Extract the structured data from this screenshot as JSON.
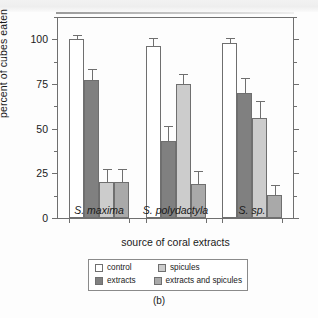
{
  "figure": {
    "caption": "(b)"
  },
  "chart_data": {
    "type": "bar",
    "title": "",
    "xlabel": "source of coral extracts",
    "ylabel": "percent of cubes eaten",
    "ylim": [
      0,
      112.5
    ],
    "yticks": [
      0,
      25,
      50,
      75,
      100
    ],
    "yticklabels": [
      "0",
      "25",
      "50",
      "75",
      "100"
    ],
    "yminorticks": [
      12.5,
      37.5,
      62.5,
      87.5,
      112.5
    ],
    "grid": false,
    "legend_position": "bottom-center",
    "categories": [
      "S. maxima",
      "S. polydactyla",
      "S. sp."
    ],
    "series": [
      {
        "name": "control",
        "color": "#ffffff",
        "values": [
          100,
          96,
          98
        ],
        "errors": [
          2,
          4,
          2
        ]
      },
      {
        "name": "extracts",
        "color": "#808080",
        "values": [
          77,
          43,
          70
        ],
        "errors": [
          6,
          8,
          8
        ]
      },
      {
        "name": "spicules",
        "color": "#cccccc",
        "values": [
          20,
          75,
          56
        ],
        "errors": [
          7,
          5,
          9
        ]
      },
      {
        "name": "extracts and spicules",
        "color": "#a9a9a9",
        "values": [
          20,
          19,
          13
        ],
        "errors": [
          7,
          7,
          5
        ]
      }
    ]
  },
  "legend": {
    "entries": [
      {
        "label": "control",
        "color": "#ffffff"
      },
      {
        "label": "spicules",
        "color": "#cccccc"
      },
      {
        "label": "extracts",
        "color": "#808080"
      },
      {
        "label": "extracts and spicules",
        "color": "#a9a9a9"
      }
    ]
  }
}
